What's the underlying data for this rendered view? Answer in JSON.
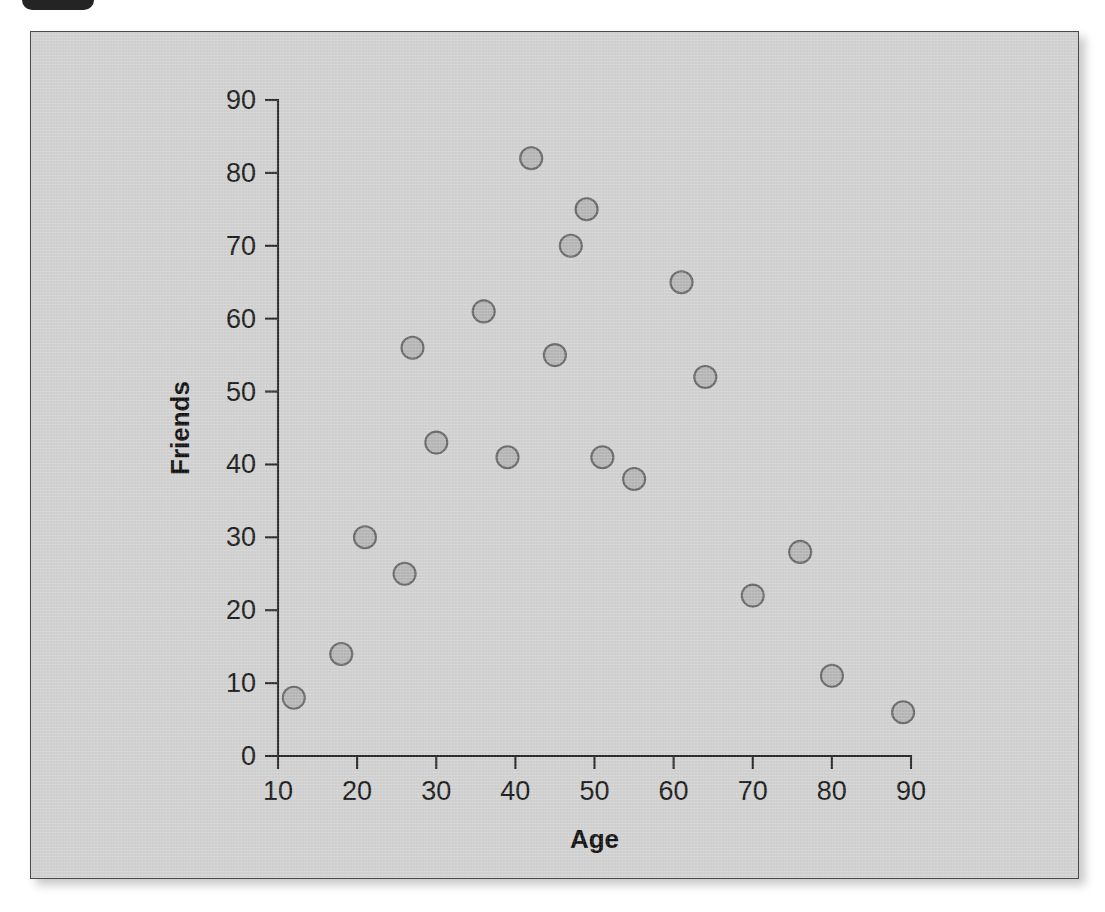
{
  "badge": {
    "name": "top-badge",
    "color": "#242424"
  },
  "figure": {
    "background": "#d4d4d4",
    "border_color": "#4a4a4a"
  },
  "chart_data": {
    "type": "scatter",
    "title": "",
    "xlabel": "Age",
    "ylabel": "Friends",
    "xlim": [
      10,
      90
    ],
    "ylim": [
      0,
      90
    ],
    "xticks": [
      10,
      20,
      30,
      40,
      50,
      60,
      70,
      80,
      90
    ],
    "yticks": [
      0,
      10,
      20,
      30,
      40,
      50,
      60,
      70,
      80,
      90
    ],
    "grid": false,
    "legend": false,
    "marker": {
      "shape": "circle",
      "fill": "#b9b9b9",
      "edge": "#6b6b6b",
      "radius": 11
    },
    "series": [
      {
        "name": "Friends vs Age",
        "points": [
          {
            "x": 12,
            "y": 8
          },
          {
            "x": 18,
            "y": 14
          },
          {
            "x": 21,
            "y": 30
          },
          {
            "x": 26,
            "y": 25
          },
          {
            "x": 27,
            "y": 56
          },
          {
            "x": 30,
            "y": 43
          },
          {
            "x": 36,
            "y": 61
          },
          {
            "x": 39,
            "y": 41
          },
          {
            "x": 42,
            "y": 82
          },
          {
            "x": 45,
            "y": 55
          },
          {
            "x": 47,
            "y": 70
          },
          {
            "x": 49,
            "y": 75
          },
          {
            "x": 51,
            "y": 41
          },
          {
            "x": 55,
            "y": 38
          },
          {
            "x": 61,
            "y": 65
          },
          {
            "x": 64,
            "y": 52
          },
          {
            "x": 70,
            "y": 22
          },
          {
            "x": 76,
            "y": 28
          },
          {
            "x": 80,
            "y": 11
          },
          {
            "x": 89,
            "y": 6
          }
        ]
      }
    ]
  }
}
